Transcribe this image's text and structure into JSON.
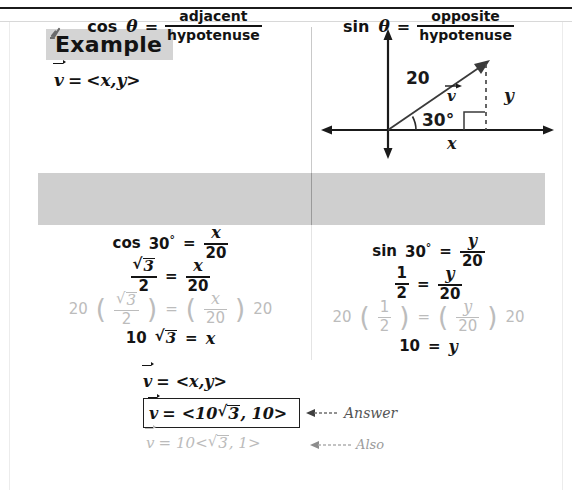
{
  "banner": {
    "label": "Example",
    "glyph_icon": "scribble-glyph-icon"
  },
  "vector_definition": {
    "symbol": "v",
    "equals": "=",
    "value": "<x,y>"
  },
  "diagram": {
    "name": "vector-component-diagram",
    "magnitude_label": "20",
    "angle_label": "30°",
    "vector_label": "v",
    "x_label": "x",
    "y_label": "y",
    "axis_color": "#1a1a1a",
    "vector_color": "#3a3a3a",
    "dashed_color": "#4a4a4a"
  },
  "band": {
    "background": "#cfcfcf",
    "left": {
      "function": "cos",
      "theta": "θ",
      "equals": "=",
      "numerator": "adjacent",
      "denominator": "hypotenuse"
    },
    "right": {
      "function": "sin",
      "theta": "θ",
      "equals": "=",
      "numerator": "opposite",
      "denominator": "hypotenuse"
    }
  },
  "work": {
    "left_column": {
      "step1": {
        "lhs_fn": "cos",
        "lhs_angle": "30",
        "lhs_degree": "°",
        "equals": "=",
        "rhs_num": "x",
        "rhs_den": "20"
      },
      "step2": {
        "lhs_radicand": "3",
        "lhs_den": "2",
        "equals": "=",
        "rhs_num": "x",
        "rhs_den": "20"
      },
      "step3": {
        "multiplier": "20",
        "lhs_radicand": "3",
        "lhs_den": "2",
        "equals": "=",
        "rhs_num": "x",
        "rhs_den": "20",
        "trailing": "20",
        "color": "#bcbcbc"
      },
      "step4": {
        "coefficient": "10",
        "radicand": "3",
        "equals": "=",
        "result": "x"
      }
    },
    "right_column": {
      "step1": {
        "lhs_fn": "sin",
        "lhs_angle": "30",
        "lhs_degree": "°",
        "equals": "=",
        "rhs_num": "y",
        "rhs_den": "20"
      },
      "step2": {
        "lhs_num": "1",
        "lhs_den": "2",
        "equals": "=",
        "rhs_num": "y",
        "rhs_den": "20"
      },
      "step3": {
        "multiplier": "20",
        "lhs_num": "1",
        "lhs_den": "2",
        "equals": "=",
        "rhs_num": "y",
        "rhs_den": "20",
        "trailing": "20",
        "color": "#bcbcbc"
      },
      "step4": {
        "lhs": "10",
        "equals": "=",
        "result": "y"
      }
    }
  },
  "conclusion": {
    "general": {
      "symbol": "v",
      "equals": "=",
      "value": "<x,y>"
    },
    "answer": {
      "symbol": "v",
      "equals": "=",
      "open": "<10",
      "radicand": "3",
      "close": ", 10>"
    },
    "also": {
      "symbol": "v",
      "equals": "=",
      "open": "10<",
      "radicand": "3",
      "close": ", 1>"
    },
    "annotations": {
      "answer_label": "Answer",
      "also_label": "Also"
    }
  }
}
